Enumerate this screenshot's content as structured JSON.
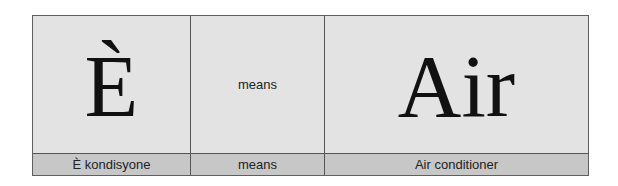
{
  "table": {
    "top_row": [
      "È",
      "means",
      "Air"
    ],
    "bottom_row": [
      "È kondisyone",
      "means",
      "Air conditioner"
    ]
  }
}
